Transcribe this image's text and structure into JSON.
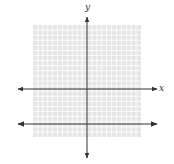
{
  "chart_data": {
    "type": "line",
    "title": "",
    "xlabel": "x",
    "ylabel": "y",
    "xlim": [
      -11,
      11
    ],
    "ylim": [
      -11,
      11
    ],
    "grid": true,
    "tick_labels": false,
    "series": [
      {
        "name": "horizontal line",
        "equation": "y = -7",
        "x": [
          -13,
          13
        ],
        "y": [
          -7,
          -7
        ]
      }
    ]
  },
  "colors": {
    "grid_background": "#e6e6e6",
    "grid_lines": "#ffffff",
    "axes": "#333333",
    "line": "#333333"
  }
}
